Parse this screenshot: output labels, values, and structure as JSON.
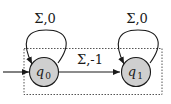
{
  "diagram": {
    "type": "finite-automaton",
    "states": [
      {
        "id": "q0",
        "name": "q",
        "sub": "0",
        "initial": true,
        "fill": "#cfcfcf"
      },
      {
        "id": "q1",
        "name": "q",
        "sub": "1",
        "initial": false,
        "fill": "#cfcfcf"
      }
    ],
    "transitions": [
      {
        "from": "q0",
        "to": "q0",
        "label": "Σ,0"
      },
      {
        "from": "q1",
        "to": "q1",
        "label": "Σ,0"
      },
      {
        "from": "q0",
        "to": "q1",
        "label": "Σ,-1"
      }
    ],
    "colors": {
      "stroke": "#1a1a1a",
      "state_fill": "#cfcfcf",
      "dashed_box": "#555555"
    }
  }
}
